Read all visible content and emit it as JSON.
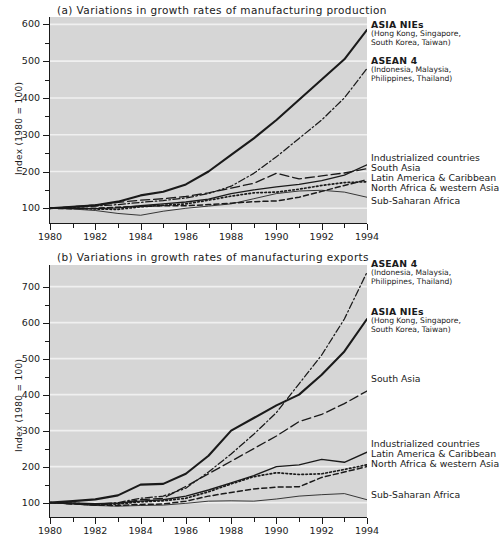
{
  "figure": {
    "background": "#ffffff",
    "plot_background": "#d6d6d6",
    "line_color": "#1a1a1a",
    "gridline_color": "#f0f0f0"
  },
  "panel_a": {
    "title": "(a) Variations in growth rates of manufacturing production",
    "ylabel": "Index (1980 = 100)",
    "legend": [
      {
        "head": "ASIA NIEs",
        "sub1": "(Hong Kong, Singapore,",
        "sub2": "South Korea, Taiwan)"
      },
      {
        "head": "ASEAN 4",
        "sub1": "(Indonesia, Malaysia,",
        "sub2": "Philippines, Thailand)"
      },
      {
        "head": "Industrialized countries"
      },
      {
        "head": "South Asia"
      },
      {
        "head": "Latin America & Caribbean"
      },
      {
        "head": "North Africa & western Asia"
      },
      {
        "head": "Sub-Saharan Africa"
      }
    ]
  },
  "panel_b": {
    "title": "(b) Variations in growth rates of manufacturing exports",
    "ylabel": "Index (1980 = 100)",
    "legend": [
      {
        "head": "ASEAN 4",
        "sub1": "(Indonesia, Malaysia,",
        "sub2": "Philippines, Thailand)"
      },
      {
        "head": "ASIA NIEs",
        "sub1": "(Hong Kong, Singapore,",
        "sub2": "South Korea, Taiwan)"
      },
      {
        "head": "South Asia"
      },
      {
        "head": "Industrialized countries"
      },
      {
        "head": "Latin America & Caribbean"
      },
      {
        "head": "North Africa & western Asia"
      },
      {
        "head": "Sub-Saharan Africa"
      }
    ]
  },
  "chart_data": [
    {
      "type": "line",
      "panel": "a",
      "title": "(a) Variations in growth rates of manufacturing production",
      "xlabel": "",
      "ylabel": "Index (1980 = 100)",
      "x": [
        1980,
        1981,
        1982,
        1983,
        1984,
        1985,
        1986,
        1987,
        1988,
        1989,
        1990,
        1991,
        1992,
        1993,
        1994
      ],
      "xlim": [
        1980,
        1994
      ],
      "ylim": [
        60,
        620
      ],
      "xticks": [
        1980,
        1982,
        1984,
        1986,
        1988,
        1990,
        1992,
        1994
      ],
      "yticks": [
        100,
        200,
        300,
        400,
        500,
        600
      ],
      "yticks_minor": [
        150,
        250,
        350,
        450,
        550
      ],
      "grid": "horizontal",
      "legend_position": "right",
      "series": [
        {
          "name": "ASIA NIEs",
          "style": "solid-thick",
          "values": [
            100,
            104,
            108,
            118,
            135,
            145,
            165,
            200,
            245,
            290,
            340,
            395,
            450,
            505,
            585
          ]
        },
        {
          "name": "ASEAN 4",
          "style": "dash-dot",
          "values": [
            100,
            103,
            106,
            110,
            116,
            121,
            128,
            140,
            160,
            195,
            240,
            290,
            340,
            400,
            480
          ]
        },
        {
          "name": "Industrialized countries",
          "style": "solid-medium",
          "values": [
            100,
            100,
            99,
            101,
            107,
            112,
            117,
            125,
            140,
            150,
            158,
            165,
            175,
            190,
            218
          ]
        },
        {
          "name": "South Asia",
          "style": "long-dash",
          "values": [
            100,
            104,
            109,
            116,
            122,
            126,
            132,
            142,
            155,
            168,
            195,
            180,
            188,
            196,
            208
          ]
        },
        {
          "name": "Latin America & Caribbean",
          "style": "dotted",
          "values": [
            100,
            101,
            98,
            97,
            104,
            108,
            112,
            122,
            133,
            142,
            144,
            152,
            162,
            170,
            172
          ]
        },
        {
          "name": "North Africa & western Asia",
          "style": "dashed",
          "values": [
            100,
            99,
            100,
            103,
            105,
            107,
            107,
            110,
            114,
            118,
            120,
            130,
            146,
            162,
            178
          ]
        },
        {
          "name": "Sub-Saharan Africa",
          "style": "solid-thin",
          "values": [
            100,
            98,
            94,
            86,
            81,
            92,
            100,
            106,
            112,
            126,
            140,
            147,
            149,
            144,
            130
          ]
        }
      ]
    },
    {
      "type": "line",
      "panel": "b",
      "title": "(b) Variations in growth rates of manufacturing exports",
      "xlabel": "",
      "ylabel": "Index (1980 = 100)",
      "x": [
        1980,
        1981,
        1982,
        1983,
        1984,
        1985,
        1986,
        1987,
        1988,
        1989,
        1990,
        1991,
        1992,
        1993,
        1994
      ],
      "xlim": [
        1980,
        1994
      ],
      "ylim": [
        60,
        760
      ],
      "xticks": [
        1980,
        1982,
        1984,
        1986,
        1988,
        1990,
        1992,
        1994
      ],
      "yticks": [
        100,
        200,
        300,
        400,
        500,
        600,
        700
      ],
      "yticks_minor": [
        150,
        250,
        350,
        450,
        550,
        650
      ],
      "grid": "horizontal",
      "legend_position": "right",
      "series": [
        {
          "name": "ASEAN 4",
          "style": "dash-dot",
          "values": [
            100,
            97,
            95,
            100,
            112,
            118,
            140,
            185,
            235,
            290,
            350,
            430,
            510,
            610,
            740
          ]
        },
        {
          "name": "ASIA NIEs",
          "style": "solid-thick",
          "values": [
            100,
            104,
            109,
            120,
            150,
            152,
            180,
            230,
            300,
            335,
            370,
            400,
            455,
            520,
            610
          ]
        },
        {
          "name": "South Asia",
          "style": "long-dash",
          "values": [
            100,
            96,
            93,
            98,
            108,
            112,
            145,
            180,
            215,
            250,
            285,
            325,
            345,
            375,
            410
          ]
        },
        {
          "name": "Industrialized countries",
          "style": "solid-medium",
          "values": [
            100,
            99,
            97,
            99,
            104,
            108,
            118,
            135,
            155,
            175,
            200,
            205,
            220,
            212,
            240
          ]
        },
        {
          "name": "Latin America & Caribbean",
          "style": "dotted",
          "values": [
            100,
            98,
            95,
            96,
            102,
            105,
            112,
            130,
            152,
            172,
            183,
            178,
            180,
            192,
            205
          ]
        },
        {
          "name": "North Africa & western Asia",
          "style": "dashed",
          "values": [
            100,
            97,
            93,
            92,
            95,
            96,
            104,
            118,
            128,
            138,
            143,
            144,
            170,
            185,
            200
          ]
        },
        {
          "name": "Sub-Saharan Africa",
          "style": "solid-thin",
          "values": [
            100,
            96,
            92,
            90,
            92,
            93,
            98,
            104,
            105,
            104,
            110,
            118,
            122,
            125,
            108
          ]
        }
      ]
    }
  ]
}
